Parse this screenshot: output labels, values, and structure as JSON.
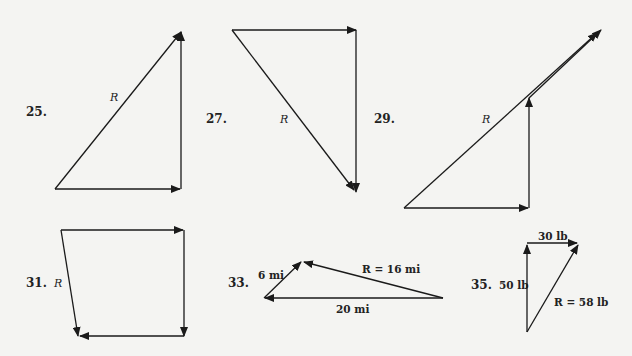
{
  "problems": [
    {
      "number": "25.",
      "resultant_label": "R"
    },
    {
      "number": "27.",
      "resultant_label": "R"
    },
    {
      "number": "29.",
      "resultant_label": "R"
    },
    {
      "number": "31.",
      "resultant_label": "R"
    },
    {
      "number": "33.",
      "labels": {
        "a": "6 mi",
        "b": "20 mi",
        "r": "R = 16 mi"
      }
    },
    {
      "number": "35.",
      "labels": {
        "a": "50 lb",
        "b": "30 lb",
        "r": "R = 58 lb"
      }
    }
  ],
  "colors": {
    "ink": "#1a1a1a",
    "paper": "#f4f4f2"
  }
}
